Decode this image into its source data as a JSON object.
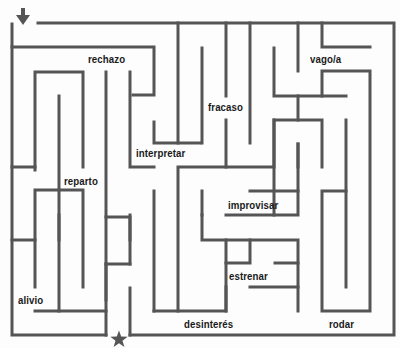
{
  "maze": {
    "wall_color": "#555555",
    "marker_color": "#555555",
    "start_marker": "down-arrow",
    "end_marker": "star",
    "words": [
      {
        "id": "rechazo",
        "text": "rechazo",
        "x": 88,
        "y": 53
      },
      {
        "id": "vago",
        "text": "vago/a",
        "x": 310,
        "y": 53
      },
      {
        "id": "fracaso",
        "text": "fracaso",
        "x": 208,
        "y": 101
      },
      {
        "id": "interpretar",
        "text": "interpretar",
        "x": 136,
        "y": 147
      },
      {
        "id": "reparto",
        "text": "reparto",
        "x": 64,
        "y": 175
      },
      {
        "id": "improvisar",
        "text": "improvisar",
        "x": 228,
        "y": 199
      },
      {
        "id": "estrenar",
        "text": "estrenar",
        "x": 229,
        "y": 270
      },
      {
        "id": "alivio",
        "text": "alivio",
        "x": 18,
        "y": 294
      },
      {
        "id": "desinteres",
        "text": "desinterés",
        "x": 184,
        "y": 318
      },
      {
        "id": "rodar",
        "text": "rodar",
        "x": 329,
        "y": 318
      }
    ]
  }
}
